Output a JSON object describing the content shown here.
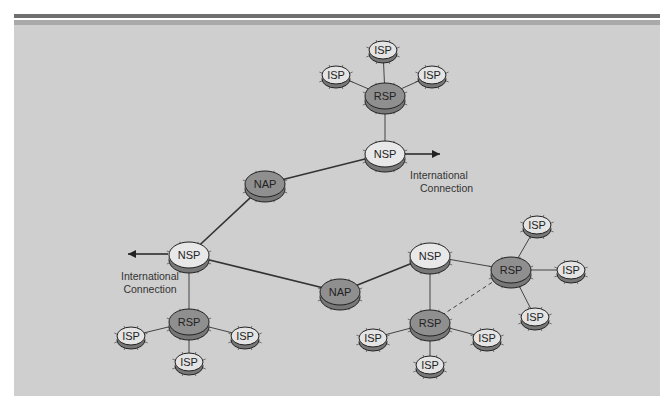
{
  "diagram": {
    "background_color": "#cfcfcf",
    "colors": {
      "isp": "#e4e4e4",
      "rsp": "#8f8f8f",
      "nsp": "#e8e8e8",
      "nap": "#8f8f8f",
      "line": "#333333"
    },
    "nodes": [
      {
        "id": "isp_t1",
        "type": "ISP",
        "label": "ISP",
        "x": 383,
        "y": 50
      },
      {
        "id": "isp_t2",
        "type": "ISP",
        "label": "ISP",
        "x": 336,
        "y": 75
      },
      {
        "id": "isp_t3",
        "type": "ISP",
        "label": "ISP",
        "x": 432,
        "y": 75
      },
      {
        "id": "rsp_t",
        "type": "RSP",
        "label": "RSP",
        "x": 385,
        "y": 96
      },
      {
        "id": "nsp_t",
        "type": "NSP",
        "label": "NSP",
        "x": 385,
        "y": 154
      },
      {
        "id": "nap_l",
        "type": "NAP",
        "label": "NAP",
        "x": 265,
        "y": 184
      },
      {
        "id": "nsp_l",
        "type": "NSP",
        "label": "NSP",
        "x": 189,
        "y": 255
      },
      {
        "id": "rsp_l",
        "type": "RSP",
        "label": "RSP",
        "x": 189,
        "y": 322
      },
      {
        "id": "isp_l1",
        "type": "ISP",
        "label": "ISP",
        "x": 131,
        "y": 336
      },
      {
        "id": "isp_l2",
        "type": "ISP",
        "label": "ISP",
        "x": 245,
        "y": 336
      },
      {
        "id": "isp_l3",
        "type": "ISP",
        "label": "ISP",
        "x": 189,
        "y": 362
      },
      {
        "id": "nap_b",
        "type": "NAP",
        "label": "NAP",
        "x": 340,
        "y": 292
      },
      {
        "id": "nsp_r",
        "type": "NSP",
        "label": "NSP",
        "x": 430,
        "y": 256
      },
      {
        "id": "rsp_r1",
        "type": "RSP",
        "label": "RSP",
        "x": 511,
        "y": 270
      },
      {
        "id": "isp_r1",
        "type": "ISP",
        "label": "ISP",
        "x": 537,
        "y": 225
      },
      {
        "id": "isp_r2",
        "type": "ISP",
        "label": "ISP",
        "x": 571,
        "y": 270
      },
      {
        "id": "isp_r3",
        "type": "ISP",
        "label": "ISP",
        "x": 535,
        "y": 317
      },
      {
        "id": "rsp_r2",
        "type": "RSP",
        "label": "RSP",
        "x": 430,
        "y": 323
      },
      {
        "id": "isp_r4",
        "type": "ISP",
        "label": "ISP",
        "x": 373,
        "y": 338
      },
      {
        "id": "isp_r5",
        "type": "ISP",
        "label": "ISP",
        "x": 487,
        "y": 338
      },
      {
        "id": "isp_r6",
        "type": "ISP",
        "label": "ISP",
        "x": 430,
        "y": 365
      }
    ],
    "edges": [
      {
        "from": "isp_t1",
        "to": "rsp_t",
        "style": "thin"
      },
      {
        "from": "isp_t2",
        "to": "rsp_t",
        "style": "thin"
      },
      {
        "from": "isp_t3",
        "to": "rsp_t",
        "style": "thin"
      },
      {
        "from": "rsp_t",
        "to": "nsp_t",
        "style": "thin"
      },
      {
        "from": "nap_l",
        "to": "nsp_t",
        "style": "thick"
      },
      {
        "from": "nap_l",
        "to": "nsp_l",
        "style": "thick"
      },
      {
        "from": "nsp_l",
        "to": "nap_b",
        "style": "thick"
      },
      {
        "from": "nap_b",
        "to": "nsp_r",
        "style": "thick"
      },
      {
        "from": "nsp_l",
        "to": "rsp_l",
        "style": "thin"
      },
      {
        "from": "rsp_l",
        "to": "isp_l1",
        "style": "thin"
      },
      {
        "from": "rsp_l",
        "to": "isp_l2",
        "style": "thin"
      },
      {
        "from": "rsp_l",
        "to": "isp_l3",
        "style": "thin"
      },
      {
        "from": "nsp_r",
        "to": "rsp_r1",
        "style": "thin"
      },
      {
        "from": "nsp_r",
        "to": "rsp_r2",
        "style": "thin"
      },
      {
        "from": "rsp_r1",
        "to": "isp_r1",
        "style": "thin"
      },
      {
        "from": "rsp_r1",
        "to": "isp_r2",
        "style": "thin"
      },
      {
        "from": "rsp_r1",
        "to": "isp_r3",
        "style": "thin"
      },
      {
        "from": "rsp_r2",
        "to": "isp_r4",
        "style": "thin"
      },
      {
        "from": "rsp_r2",
        "to": "isp_r5",
        "style": "thin"
      },
      {
        "from": "rsp_r2",
        "to": "isp_r6",
        "style": "thin"
      },
      {
        "from": "rsp_r2",
        "to": "rsp_r1",
        "style": "dashed"
      }
    ],
    "annotations": [
      {
        "id": "intl_top",
        "line1": "International",
        "line2": "Connection",
        "x": 410,
        "y": 171,
        "arrow_from": [
          405,
          154
        ],
        "arrow_to": [
          440,
          154
        ],
        "anchor": "start"
      },
      {
        "id": "intl_left",
        "line1": "International",
        "line2": "Connection",
        "x": 150,
        "y": 272,
        "arrow_from": [
          168,
          254
        ],
        "arrow_to": [
          128,
          254
        ],
        "anchor": "middle"
      }
    ]
  }
}
